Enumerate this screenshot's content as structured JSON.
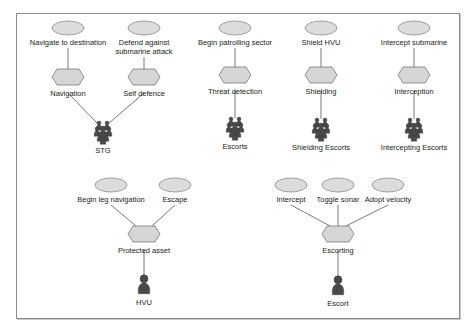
{
  "colors": {
    "ellipse_fill": "#dcdcdc",
    "ellipse_stroke": "#8c8c8c",
    "hexagon_fill": "#d6d6d6",
    "hexagon_stroke": "#7a7a7a",
    "line": "#555555",
    "actor": "#4a4a4a",
    "border": "#8a8a8a"
  },
  "diagrams": [
    {
      "id": "stg",
      "goals": [
        {
          "label": "Navigate to destination",
          "x": 68,
          "y": 28
        },
        {
          "label": "Defend against\nsubmarine attack",
          "x": 144,
          "y": 28
        }
      ],
      "role": {
        "label": "Navigation",
        "x": 68,
        "y": 77
      },
      "role2": {
        "label": "Self defence",
        "x": 144,
        "y": 77
      },
      "actor": {
        "label": "STG",
        "type": "group",
        "x": 103,
        "y": 131
      }
    }
  ],
  "nodes": {
    "goals": [
      {
        "id": "g1",
        "label": "Navigate to destination",
        "x": 68,
        "y": 28
      },
      {
        "id": "g2",
        "label": "Defend against\nsubmarine attack",
        "x": 144,
        "y": 28
      },
      {
        "id": "g3",
        "label": "Begin patrolling sector",
        "x": 235,
        "y": 28
      },
      {
        "id": "g4",
        "label": "Shield HVU",
        "x": 321,
        "y": 28
      },
      {
        "id": "g5",
        "label": "Intercept submarine",
        "x": 414,
        "y": 28
      },
      {
        "id": "g6",
        "label": "Begin leg navigation",
        "x": 111,
        "y": 185
      },
      {
        "id": "g7",
        "label": "Escape",
        "x": 175,
        "y": 185
      },
      {
        "id": "g8",
        "label": "Intercept",
        "x": 291,
        "y": 185
      },
      {
        "id": "g9",
        "label": "Toggle sonar",
        "x": 338,
        "y": 185
      },
      {
        "id": "g10",
        "label": "Adopt velocity",
        "x": 388,
        "y": 185
      }
    ],
    "roles": [
      {
        "id": "r1",
        "label": "Navigation",
        "x": 68,
        "y": 77
      },
      {
        "id": "r2",
        "label": "Self defence",
        "x": 144,
        "y": 77
      },
      {
        "id": "r3",
        "label": "Threat detection",
        "x": 235,
        "y": 75
      },
      {
        "id": "r4",
        "label": "Shielding",
        "x": 321,
        "y": 75
      },
      {
        "id": "r5",
        "label": "Interception",
        "x": 414,
        "y": 75
      },
      {
        "id": "r6",
        "label": "Protected asset",
        "x": 144,
        "y": 234
      },
      {
        "id": "r7",
        "label": "Escorting",
        "x": 338,
        "y": 234
      }
    ],
    "actors": [
      {
        "id": "a1",
        "label": "STG",
        "type": "group",
        "x": 103,
        "y": 132
      },
      {
        "id": "a2",
        "label": "Escorts",
        "type": "group",
        "x": 235,
        "y": 128
      },
      {
        "id": "a3",
        "label": "Shielding Escorts",
        "type": "group",
        "x": 321,
        "y": 129
      },
      {
        "id": "a4",
        "label": "Intercepting Escorts",
        "type": "group",
        "x": 414,
        "y": 129
      },
      {
        "id": "a5",
        "label": "HVU",
        "type": "single",
        "x": 144,
        "y": 285
      },
      {
        "id": "a6",
        "label": "Escort",
        "type": "single",
        "x": 338,
        "y": 286
      }
    ]
  },
  "edges": [
    {
      "from": "g1",
      "to": "r1"
    },
    {
      "from": "g2",
      "to": "r2"
    },
    {
      "from": "r1",
      "to": "a1"
    },
    {
      "from": "r2",
      "to": "a1"
    },
    {
      "from": "g3",
      "to": "r3"
    },
    {
      "from": "r3",
      "to": "a2"
    },
    {
      "from": "g4",
      "to": "r4"
    },
    {
      "from": "r4",
      "to": "a3"
    },
    {
      "from": "g5",
      "to": "r5"
    },
    {
      "from": "r5",
      "to": "a4"
    },
    {
      "from": "g6",
      "to": "r6"
    },
    {
      "from": "g7",
      "to": "r6"
    },
    {
      "from": "r6",
      "to": "a5"
    },
    {
      "from": "g8",
      "to": "r7"
    },
    {
      "from": "g9",
      "to": "r7"
    },
    {
      "from": "g10",
      "to": "r7"
    },
    {
      "from": "r7",
      "to": "a6"
    }
  ]
}
